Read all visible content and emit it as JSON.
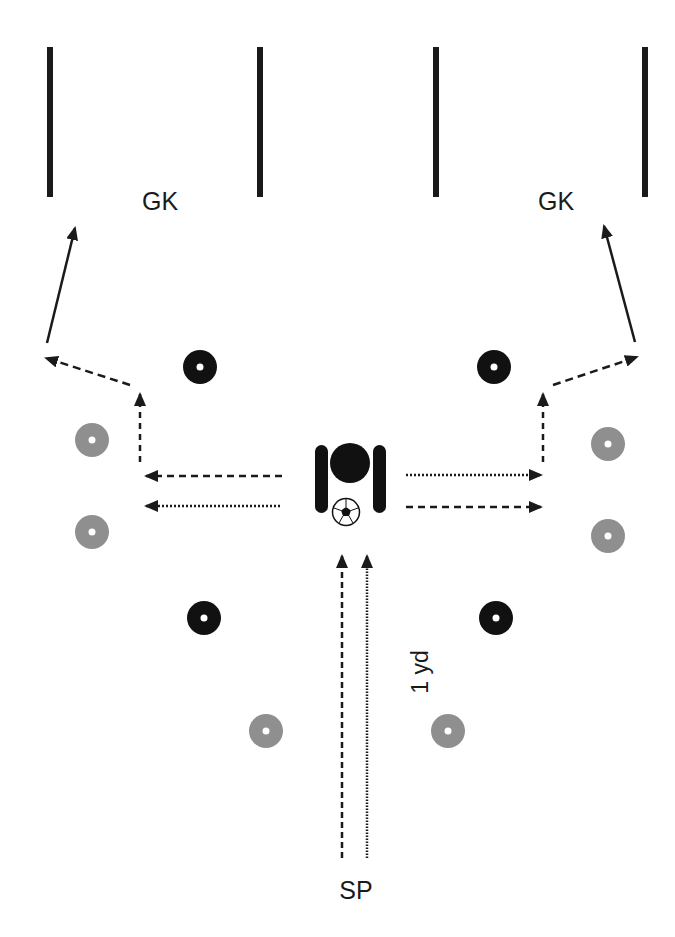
{
  "diagram": {
    "type": "soccer-drill",
    "labels": {
      "gk_left": "GK",
      "gk_right": "GK",
      "distance": "1 yd",
      "start_position": "SP"
    },
    "colors": {
      "black_cone": "#111111",
      "grey_cone": "#8f8f8f",
      "line": "#1a1a1a",
      "background": "#ffffff"
    },
    "goals": [
      {
        "name": "left-goal",
        "posts_x": [
          50,
          260
        ],
        "y_top": 47,
        "y_bottom": 197
      },
      {
        "name": "right-goal",
        "posts_x": [
          436,
          645
        ],
        "y_top": 47,
        "y_bottom": 197
      }
    ],
    "black_cones": [
      {
        "x": 200,
        "y": 367
      },
      {
        "x": 494,
        "y": 367
      },
      {
        "x": 204,
        "y": 618
      },
      {
        "x": 496,
        "y": 618
      }
    ],
    "grey_cones": [
      {
        "x": 92,
        "y": 440
      },
      {
        "x": 92,
        "y": 532
      },
      {
        "x": 608,
        "y": 444
      },
      {
        "x": 608,
        "y": 536
      },
      {
        "x": 266,
        "y": 731
      },
      {
        "x": 448,
        "y": 731
      }
    ],
    "player": {
      "x": 350,
      "y": 463
    },
    "ball": {
      "x": 346,
      "y": 512
    }
  }
}
